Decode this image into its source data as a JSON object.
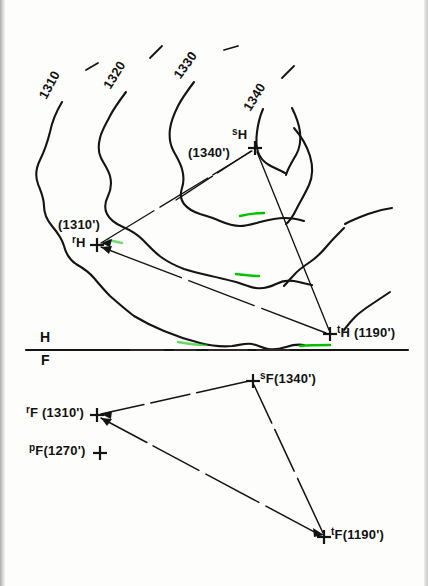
{
  "sheet": {
    "title": "Descriptive geometry: topographic contour map with H/F fold line",
    "width": 428,
    "height": 586,
    "ink_color": "#141414",
    "paper_color": "#fdfdfc",
    "highlight_color": "#00c000"
  },
  "contour_labels": [
    {
      "name": "contour-1310",
      "text": "1310",
      "x": 48,
      "y": 88,
      "rotation": -62
    },
    {
      "name": "contour-1320",
      "text": "1320",
      "x": 112,
      "y": 78,
      "rotation": -58
    },
    {
      "name": "contour-1330",
      "text": "1330",
      "x": 182,
      "y": 68,
      "rotation": -55
    },
    {
      "name": "contour-1340",
      "text": "1340",
      "x": 252,
      "y": 100,
      "rotation": -58
    }
  ],
  "contour_ticks": [
    {
      "name": "tick-1310",
      "x": 88,
      "y": 67,
      "rotation": -22
    },
    {
      "name": "tick-1320",
      "x": 152,
      "y": 52,
      "rotation": -35
    },
    {
      "name": "tick-1330",
      "x": 226,
      "y": 48,
      "rotation": -8
    },
    {
      "name": "tick-1340",
      "x": 284,
      "y": 73,
      "rotation": -30
    }
  ],
  "top_view": {
    "name": "horizontal-projection-view",
    "view_letter": "H",
    "points": [
      {
        "name": "point-s-h",
        "id": "s",
        "subscript": "H",
        "elevation_text": "(1340')",
        "marker_x": 255,
        "marker_y": 148,
        "label_x": 232,
        "label_y": 134,
        "elev_x": 190,
        "elev_y": 152
      },
      {
        "name": "point-r-h",
        "id": "r",
        "subscript": "H",
        "elevation_text": "(1310')",
        "marker_x": 97,
        "marker_y": 245,
        "label_x": 75,
        "label_y": 239,
        "elev_x": 60,
        "elev_y": 221
      },
      {
        "name": "point-t-h",
        "id": "t",
        "subscript": "H",
        "elevation_text": "(1190')",
        "marker_x": 330,
        "marker_y": 334,
        "label_x": 338,
        "label_y": 328,
        "elev_x": 357,
        "elev_y": 329
      }
    ]
  },
  "fold_line": {
    "name": "fold-line-hf",
    "upper_letter": "H",
    "lower_letter": "F",
    "y": 350,
    "x_start": 26,
    "x_end": 408,
    "letter_h_x": 40,
    "letter_h_y": 332,
    "letter_f_x": 41,
    "letter_f_y": 353
  },
  "front_view": {
    "name": "frontal-projection-view",
    "view_letter": "F",
    "points": [
      {
        "name": "point-s-f",
        "id": "s",
        "subscript": "F",
        "elevation_text": "(1340')",
        "marker_x": 253,
        "marker_y": 381,
        "label_x": 261,
        "label_y": 374
      },
      {
        "name": "point-r-f",
        "id": "r",
        "subscript": "F",
        "elevation_text": "(1310')",
        "marker_x": 97,
        "marker_y": 415,
        "label_x": 26,
        "label_y": 408
      },
      {
        "name": "point-p-f",
        "id": "p",
        "subscript": "F",
        "elevation_text": "(1270')",
        "marker_x": 100,
        "marker_y": 453,
        "label_x": 29,
        "label_y": 446
      },
      {
        "name": "point-t-f",
        "id": "t",
        "subscript": "F",
        "elevation_text": "(1190')",
        "marker_x": 324,
        "marker_y": 537,
        "label_x": 332,
        "label_y": 530
      }
    ]
  }
}
